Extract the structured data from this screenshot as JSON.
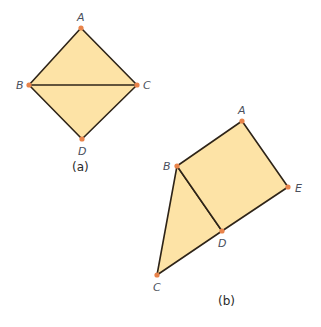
{
  "colors": {
    "fill": "#fde3a6",
    "stroke": "#2e2418",
    "vertex": "#e8834a",
    "label": "#4a4f5c"
  },
  "figure_a": {
    "caption": "(a)",
    "vertices": {
      "A": {
        "label": "A",
        "x": 81,
        "y": 28
      },
      "B": {
        "label": "B",
        "x": 29,
        "y": 85
      },
      "C": {
        "label": "C",
        "x": 137,
        "y": 85
      },
      "D": {
        "label": "D",
        "x": 82,
        "y": 139
      }
    },
    "edges": [
      "AB",
      "AC",
      "BD",
      "CD",
      "BC"
    ]
  },
  "figure_b": {
    "caption": "(b)",
    "vertices": {
      "A": {
        "label": "A",
        "x": 242,
        "y": 121
      },
      "B": {
        "label": "B",
        "x": 177,
        "y": 166
      },
      "C": {
        "label": "C",
        "x": 157,
        "y": 275
      },
      "D": {
        "label": "D",
        "x": 222,
        "y": 231
      },
      "E": {
        "label": "E",
        "x": 288,
        "y": 187
      }
    },
    "edges": [
      "AB",
      "AE",
      "ED",
      "BD",
      "BC",
      "CD"
    ]
  }
}
